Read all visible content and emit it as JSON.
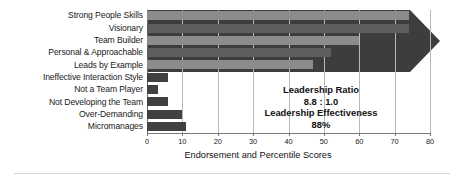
{
  "chart_data": {
    "type": "bar",
    "orientation": "horizontal",
    "title": "",
    "xlabel": "Endorsement and Percentile Scores",
    "ylabel": "",
    "xlim": [
      0,
      80
    ],
    "xticks": [
      0,
      10,
      20,
      30,
      40,
      50,
      60,
      70,
      80
    ],
    "xtick_labels": [
      "0",
      "10",
      "20",
      "30",
      "40",
      "50",
      "60",
      "70",
      "80"
    ],
    "grid": true,
    "grid_axis": "x",
    "legend": false,
    "categories": [
      "Strong People Skills",
      "Visionary",
      "Team Builder",
      "Personal & Approachable",
      "Leads by Example",
      "Ineffective Interaction Style",
      "Not a Team Player",
      "Not Developing the Team",
      "Over-Demanding",
      "Micromanages"
    ],
    "values": [
      74,
      74,
      60,
      52,
      47,
      6,
      3,
      6,
      10,
      11
    ],
    "bar_colors": [
      "#8c8c8c",
      "#5e5e5e",
      "#8c8c8c",
      "#5e5e5e",
      "#8c8c8c",
      "#414141",
      "#414141",
      "#414141",
      "#414141",
      "#414141"
    ],
    "annotations": [
      "Leadership Ratio",
      "8.8 : 1.0",
      "Leadership Effectiveness",
      "88%"
    ]
  },
  "colors": {
    "background": "#ffffff",
    "bar_light": "#8c8c8c",
    "bar_dark": "#5e5e5e",
    "bar_negative": "#414141",
    "arrow": "#3d3d3d",
    "gridline": "#b9b9b9",
    "axis": "#7a7a7a",
    "text": "#111111"
  },
  "decor": {
    "arrow_shape": "right-pointing-chevron"
  }
}
